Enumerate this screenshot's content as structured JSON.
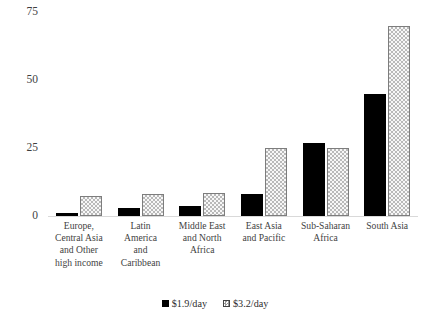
{
  "chart_data": {
    "type": "bar",
    "title": "",
    "subtitle": "",
    "xlabel": "",
    "ylabel": "",
    "ylim": [
      0,
      75
    ],
    "yticks": [
      0,
      25,
      50,
      75
    ],
    "ytick_labels": [
      "0",
      "25",
      "50",
      "75"
    ],
    "grid": false,
    "legend_position": "bottom-center",
    "categories": [
      "Europe, Central Asia and Other high income",
      "Latin America and Caribbean",
      "Middle East and North Africa",
      "East Asia and Pacific",
      "Sub-Saharan Africa",
      "South Asia"
    ],
    "category_label_lines": [
      [
        "Europe,",
        "Central Asia",
        "and Other",
        "high income"
      ],
      [
        "Latin",
        "America",
        "and",
        "Caribbean"
      ],
      [
        "Middle East",
        "and North",
        "Africa"
      ],
      [
        "East Asia",
        "and Pacific"
      ],
      [
        "Sub-Saharan",
        "Africa"
      ],
      [
        "South Asia"
      ]
    ],
    "series": [
      {
        "name": "$1.9/day",
        "color": "#000000",
        "pattern": "solid",
        "values": [
          1,
          3,
          3.5,
          8,
          27,
          45
        ]
      },
      {
        "name": "$3.2/day",
        "color": "#f2f2f2",
        "pattern": "checker-dot",
        "values": [
          7.5,
          8,
          8.5,
          25,
          25,
          70
        ]
      }
    ]
  }
}
